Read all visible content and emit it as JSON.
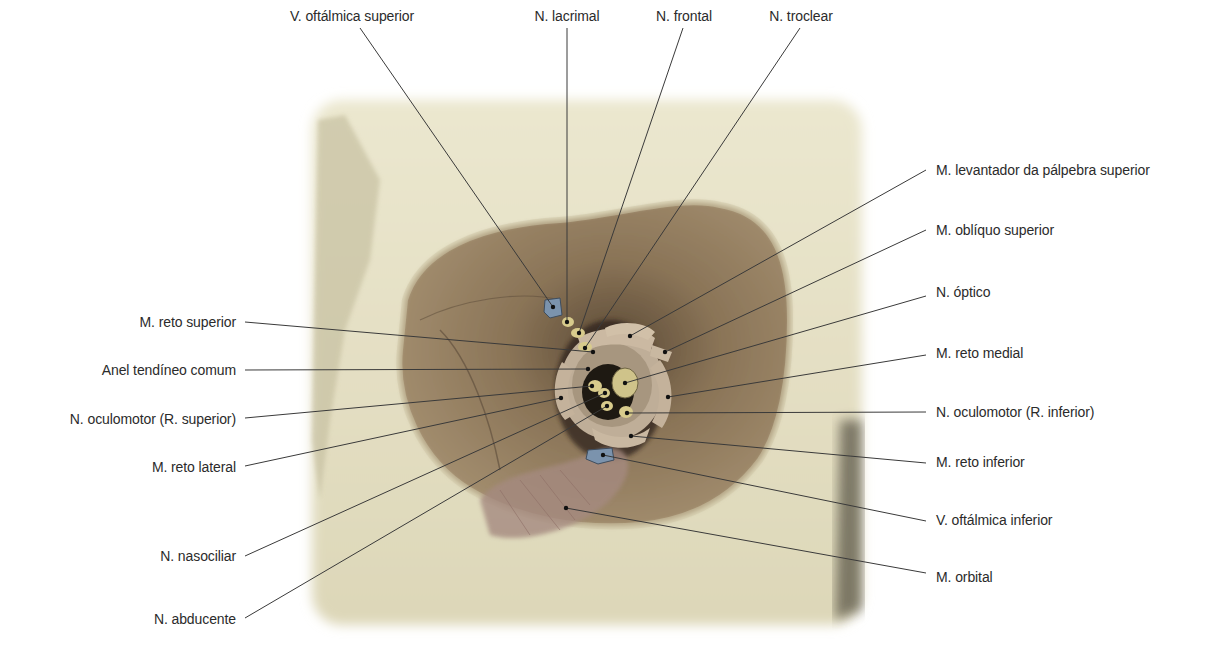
{
  "figure": {
    "colors": {
      "bone": "#e7e2c9",
      "orbit_wall": "#8c7658",
      "tendon_ring": "#bfae98",
      "nerve": "#d8cb8c",
      "vein": "#7b93ad",
      "leader_line": "#3a3a3a",
      "label_text": "#2b2b2b"
    },
    "labels": {
      "top": [
        {
          "text": "V. oftálmica superior",
          "x": 352,
          "y": 8
        },
        {
          "text": "N. lacrimal",
          "x": 567,
          "y": 8
        },
        {
          "text": "N. frontal",
          "x": 684,
          "y": 8
        },
        {
          "text": "N. troclear",
          "x": 801,
          "y": 8
        }
      ],
      "right": [
        {
          "text": "M. levantador da pálpebra superior",
          "x": 936,
          "y": 162
        },
        {
          "text": "M. oblíquo superior",
          "x": 936,
          "y": 222
        },
        {
          "text": "N. óptico",
          "x": 936,
          "y": 284
        },
        {
          "text": "M. reto medial",
          "x": 936,
          "y": 345
        },
        {
          "text": "N. oculomotor (R. inferior)",
          "x": 936,
          "y": 404
        },
        {
          "text": "M. reto inferior",
          "x": 936,
          "y": 454
        },
        {
          "text": "V. oftálmica inferior",
          "x": 936,
          "y": 512
        },
        {
          "text": "M. orbital",
          "x": 936,
          "y": 569
        }
      ],
      "left": [
        {
          "text": "M. reto superior",
          "right": 988,
          "y": 314
        },
        {
          "text": "Anel tendíneo comum",
          "right": 988,
          "y": 362
        },
        {
          "text": "N. oculomotor (R. superior)",
          "right": 988,
          "y": 411
        },
        {
          "text": "M. reto lateral",
          "right": 988,
          "y": 459
        },
        {
          "text": "N. nasociliar",
          "right": 988,
          "y": 548
        },
        {
          "text": "N. abducente",
          "right": 988,
          "y": 611
        }
      ]
    }
  }
}
